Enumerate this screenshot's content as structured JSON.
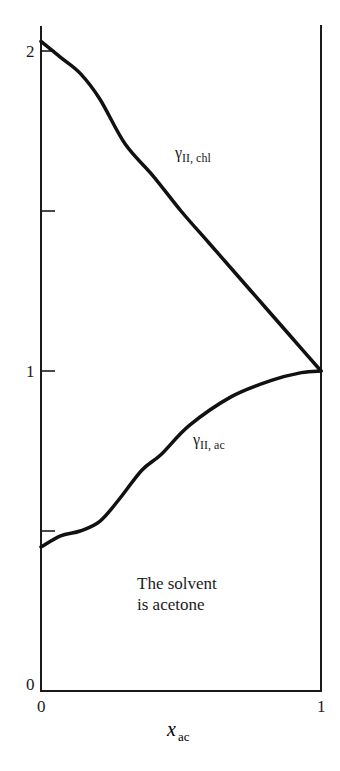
{
  "chart_data": {
    "type": "line",
    "title": "",
    "xlabel": "x_ac",
    "xlabel_main": "x",
    "xlabel_sub": "ac",
    "ylabel": "",
    "xlim": [
      0,
      1
    ],
    "ylim": [
      0,
      2.05
    ],
    "grid": false,
    "legend": "none (inline curve labels)",
    "x_ticks": [
      0,
      1
    ],
    "x_tick_labels": [
      "0",
      "1"
    ],
    "y_ticks": [
      0,
      0.5,
      1,
      1.5,
      2
    ],
    "y_tick_labels": [
      "0",
      "",
      "1",
      "",
      "2"
    ],
    "series": [
      {
        "name": "γII,chl",
        "label_main": "γ",
        "label_sub": "II, chl",
        "x": [
          0,
          0.07,
          0.14,
          0.21,
          0.3,
          0.4,
          0.5,
          0.6,
          0.7,
          0.8,
          0.9,
          1.0
        ],
        "y": [
          2.03,
          1.98,
          1.93,
          1.85,
          1.71,
          1.61,
          1.5,
          1.4,
          1.3,
          1.2,
          1.1,
          1.0
        ]
      },
      {
        "name": "γII,ac",
        "label_main": "γ",
        "label_sub": "II, ac",
        "x": [
          0,
          0.07,
          0.14,
          0.21,
          0.28,
          0.36,
          0.43,
          0.53,
          0.68,
          0.82,
          0.93,
          1.0
        ],
        "y": [
          0.45,
          0.485,
          0.5,
          0.53,
          0.6,
          0.69,
          0.74,
          0.83,
          0.92,
          0.97,
          0.995,
          1.0
        ]
      }
    ],
    "annotations": [
      "The solvent",
      "is acetone"
    ]
  }
}
